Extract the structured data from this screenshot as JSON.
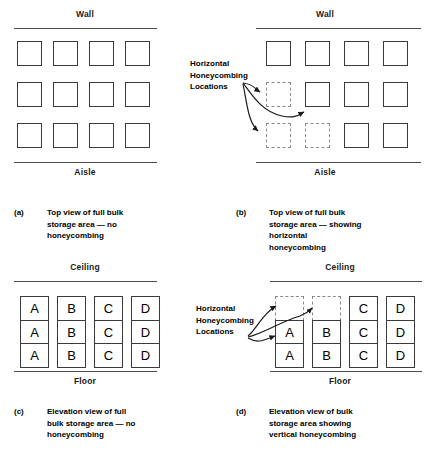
{
  "figure": {
    "panels": [
      {
        "id": "a",
        "tag": "(a)",
        "caption": "Top view of full bulk storage area — no honeycombing",
        "type": "top-view",
        "top_label": "Wall",
        "bottom_label": "Aisle",
        "rows": 3,
        "cols": 4,
        "empty_cells": []
      },
      {
        "id": "b",
        "tag": "(b)",
        "caption": "Top view of full bulk storage area — showing horizontal honeycombing",
        "type": "top-view",
        "top_label": "Wall",
        "bottom_label": "Aisle",
        "rows": 3,
        "cols": 4,
        "empty_cells": [
          [
            1,
            0
          ],
          [
            2,
            0
          ],
          [
            2,
            1
          ]
        ],
        "callout": "Horizontal\nHoneycombing\nLocations",
        "callout_lines": [
          "Horizontal",
          "Honeycombing",
          "Locations"
        ]
      },
      {
        "id": "c",
        "tag": "(c)",
        "caption": "Elevation view of full bulk storage area — no honeycombing",
        "type": "elevation",
        "top_label": "Ceiling",
        "bottom_label": "Floor",
        "columns": [
          {
            "label": "A",
            "cells": [
              "A",
              "A",
              "A"
            ]
          },
          {
            "label": "B",
            "cells": [
              "B",
              "B",
              "B"
            ]
          },
          {
            "label": "C",
            "cells": [
              "C",
              "C",
              "C"
            ]
          },
          {
            "label": "D",
            "cells": [
              "D",
              "D",
              "D"
            ]
          }
        ]
      },
      {
        "id": "d",
        "tag": "(d)",
        "caption": "Elevation view of bulk storage area showing vertical honeycombing",
        "type": "elevation",
        "top_label": "Ceiling",
        "bottom_label": "Floor",
        "callout_lines": [
          "Horizontal",
          "Honeycombing",
          "Locations"
        ],
        "columns": [
          {
            "label": "A",
            "cells": [
              "",
              "A",
              "A"
            ],
            "empty_rows": [
              0
            ]
          },
          {
            "label": "B",
            "cells": [
              "",
              "B",
              "B"
            ],
            "empty_rows": [
              0
            ]
          },
          {
            "label": "C",
            "cells": [
              "C",
              "C",
              "C"
            ],
            "empty_rows": []
          },
          {
            "label": "D",
            "cells": [
              "D",
              "D",
              "D"
            ],
            "empty_rows": []
          }
        ]
      }
    ],
    "colors": {
      "line": "#3a3a3a",
      "boundary": "#4a4a4a",
      "dashed": "#8a8a8a",
      "text": "#000000",
      "background": "#ffffff"
    }
  }
}
